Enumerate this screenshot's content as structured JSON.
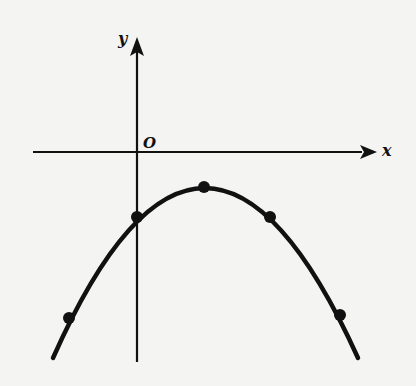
{
  "diagram": {
    "type": "parabola-graph",
    "axes": {
      "x_label": "x",
      "y_label": "y",
      "origin_label": "O"
    },
    "curve": {
      "shape": "parabola",
      "opens": "down",
      "vertex_position": "right of y-axis, below x-axis"
    },
    "points": [
      {
        "name": "left-lower-point",
        "px": [
          69,
          318
        ]
      },
      {
        "name": "y-intercept-point",
        "px": [
          137,
          217
        ]
      },
      {
        "name": "vertex-point",
        "px": [
          204,
          187
        ]
      },
      {
        "name": "symmetric-point",
        "px": [
          270,
          217
        ]
      },
      {
        "name": "right-lower-point",
        "px": [
          340,
          315
        ]
      }
    ],
    "colors": {
      "ink": "#111111",
      "background": "#f4f4f2"
    }
  }
}
